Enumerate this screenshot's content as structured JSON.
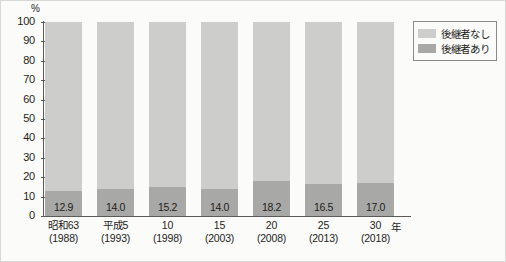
{
  "chart_data": {
    "type": "bar",
    "title": "",
    "subtitle": "",
    "xlabel": "",
    "ylabel": "",
    "unit_label": "%",
    "x_axis_unit": "年",
    "stacked": true,
    "stack_total": 100,
    "grid": false,
    "legend_position": "top-right",
    "ylim": [
      0,
      100
    ],
    "yticks": [
      "100",
      "90",
      "80",
      "70",
      "60",
      "50",
      "40",
      "30",
      "20",
      "10",
      "0"
    ],
    "categories": [
      {
        "line1": "昭和63",
        "line2": "(1988)"
      },
      {
        "line1": "平成5",
        "line2": "(1993)"
      },
      {
        "line1": "10",
        "line2": "(1998)"
      },
      {
        "line1": "15",
        "line2": "(2003)"
      },
      {
        "line1": "20",
        "line2": "(2008)"
      },
      {
        "line1": "25",
        "line2": "(2013)"
      },
      {
        "line1": "30",
        "line2": "(2018)"
      }
    ],
    "series": [
      {
        "name": "後継者なし",
        "color": "#cdcdcb",
        "values": [
          87.1,
          86.0,
          84.8,
          86.0,
          81.8,
          83.5,
          83.0
        ]
      },
      {
        "name": "後継者あり",
        "color": "#a8a8a6",
        "values": [
          12.9,
          14.0,
          15.2,
          14.0,
          18.2,
          16.5,
          17.0
        ]
      }
    ],
    "data_labels": [
      "12.9",
      "14.0",
      "15.2",
      "14.0",
      "18.2",
      "16.5",
      "17.0"
    ]
  },
  "legend": {
    "items": [
      {
        "label": "後継者なし",
        "color": "#cdcdcb"
      },
      {
        "label": "後継者あり",
        "color": "#a8a8a6"
      }
    ]
  }
}
